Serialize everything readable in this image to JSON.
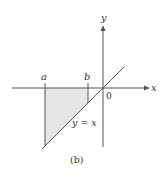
{
  "figure": {
    "caption": "(b)",
    "colors": {
      "axis": "#555555",
      "line": "#555555",
      "region_fill": "#e6e6e6",
      "text": "#333333",
      "background": "#ffffff"
    },
    "axes": {
      "x_label": "x",
      "y_label": "y",
      "origin_label": "0"
    },
    "points": {
      "a_label": "a",
      "b_label": "b"
    },
    "line": {
      "equation_label": "y = x"
    },
    "region": {
      "description": "shaded region between x=a and x=b, bounded above by the x-axis and below by y = x"
    }
  }
}
